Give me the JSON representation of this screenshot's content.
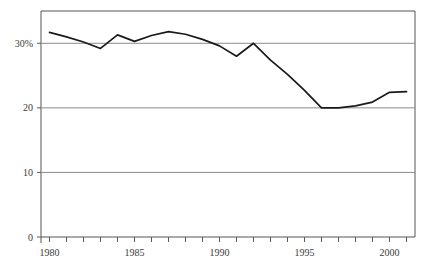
{
  "chart_data": {
    "type": "line",
    "title": "",
    "subtitle": "",
    "xlabel": "",
    "ylabel": "",
    "xlim": [
      1979.5,
      2001.5
    ],
    "ylim": [
      0,
      35
    ],
    "grid": true,
    "grid_axis": "y",
    "legend": "none",
    "line_color": "#1a1a1a",
    "grid_color": "#8c8c8c",
    "axis_color": "#5a5a5a",
    "y_ticks": [
      0,
      10,
      20,
      30
    ],
    "y_tick_labels": [
      "0",
      "10",
      "20",
      "30%"
    ],
    "x_ticks": [
      1980,
      1981,
      1982,
      1983,
      1984,
      1985,
      1986,
      1987,
      1988,
      1989,
      1990,
      1991,
      1992,
      1993,
      1994,
      1995,
      1996,
      1997,
      1998,
      1999,
      2000,
      2001
    ],
    "x_tick_labels_shown": [
      "1980",
      "1985",
      "1990",
      "1995",
      "2000"
    ],
    "x_tick_label_years": [
      1980,
      1985,
      1990,
      1995,
      2000
    ],
    "x": [
      1980,
      1981,
      1982,
      1983,
      1984,
      1985,
      1986,
      1987,
      1988,
      1989,
      1990,
      1991,
      1992,
      1993,
      1994,
      1995,
      1996,
      1997,
      1998,
      1999,
      2000,
      2001
    ],
    "values": [
      31.7,
      31.0,
      30.2,
      29.2,
      31.3,
      30.3,
      31.2,
      31.8,
      31.4,
      30.6,
      29.6,
      28.0,
      30.0,
      27.4,
      25.2,
      22.7,
      20.0,
      20.0,
      20.3,
      20.9,
      22.4,
      22.5
    ],
    "series": [
      {
        "name": "share",
        "values": [
          31.7,
          31.0,
          30.2,
          29.2,
          31.3,
          30.3,
          31.2,
          31.8,
          31.4,
          30.6,
          29.6,
          28.0,
          30.0,
          27.4,
          25.2,
          22.7,
          20.0,
          20.0,
          20.3,
          20.9,
          22.4,
          22.5
        ]
      }
    ]
  }
}
